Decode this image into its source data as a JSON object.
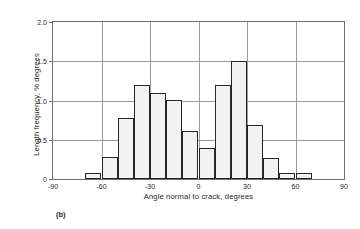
{
  "figure": {
    "caption": "(b)"
  },
  "chart_data": {
    "type": "bar",
    "title": "",
    "subtitle": "",
    "xlabel": "Angle normal to crack, degrees",
    "ylabel": "Length frequency, % degrees",
    "xlim": [
      -90,
      90
    ],
    "ylim": [
      0,
      2.0
    ],
    "grid": true,
    "legend": null,
    "bin_width": 10,
    "x_ticks": [
      -90,
      -60,
      -30,
      0,
      30,
      60,
      90
    ],
    "x_tick_labels": [
      "-90",
      "-60",
      "-30",
      "0",
      "30",
      "60",
      "90"
    ],
    "y_ticks": [
      0,
      0.5,
      1.0,
      1.5,
      2.0
    ],
    "y_tick_labels": [
      "0",
      "0.5",
      "1.0",
      "1.5",
      "2.0"
    ],
    "categories": [
      -70,
      -60,
      -50,
      -40,
      -30,
      -20,
      -10,
      0,
      10,
      20,
      30,
      40,
      50,
      60
    ],
    "bin_edges": [
      -70,
      -60,
      -50,
      -40,
      -30,
      -20,
      -10,
      0,
      10,
      20,
      30,
      40,
      50,
      60,
      70
    ],
    "values": [
      0.08,
      0.28,
      0.78,
      1.2,
      1.1,
      1.01,
      0.61,
      0.39,
      1.2,
      1.5,
      0.69,
      0.27,
      0.08,
      0.08
    ],
    "bar_fill": "#f2f2f0",
    "bar_edge": "#262626",
    "grid_color": "#9a9a9a",
    "frame_color": "#6f6f6f"
  }
}
